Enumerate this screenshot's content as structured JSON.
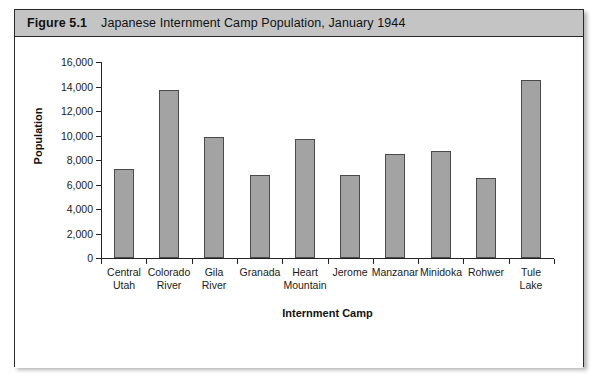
{
  "figure": {
    "number": "Figure 5.1",
    "title": "Japanese Internment Camp Population, January 1944"
  },
  "colors": {
    "header_band": "#c4c4c4",
    "bar_fill": "#a3a3a3",
    "bar_border": "#4a4a4a",
    "axis": "#222222",
    "panel_background": "#ffffff"
  },
  "chart_data": {
    "type": "bar",
    "title": "Japanese Internment Camp Population, January 1944",
    "xlabel": "Internment Camp",
    "ylabel": "Population",
    "ylim": [
      0,
      16000
    ],
    "ytick_step": 2000,
    "grid": false,
    "legend": null,
    "ytick_labels": [
      "0",
      "2,000",
      "4,000",
      "6,000",
      "8,000",
      "10,000",
      "12,000",
      "14,000",
      "16,000"
    ],
    "ytick_values": [
      0,
      2000,
      4000,
      6000,
      8000,
      10000,
      12000,
      14000,
      16000
    ],
    "categories": [
      "Central Utah",
      "Colorado River",
      "Gila River",
      "Granada",
      "Heart Mountain",
      "Jerome",
      "Manzanar",
      "Minidoka",
      "Rohwer",
      "Tule Lake"
    ],
    "category_lines": [
      [
        "Central",
        "Utah"
      ],
      [
        "Colorado",
        "River"
      ],
      [
        "Gila",
        "River"
      ],
      [
        "Granada",
        ""
      ],
      [
        "Heart",
        "Mountain"
      ],
      [
        "Jerome",
        ""
      ],
      [
        "Manzanar",
        ""
      ],
      [
        "Minidoka",
        ""
      ],
      [
        "Rohwer",
        ""
      ],
      [
        "Tule",
        "Lake"
      ]
    ],
    "values": [
      7300,
      13700,
      9850,
      6800,
      9700,
      6800,
      8500,
      8700,
      6500,
      14500
    ]
  }
}
